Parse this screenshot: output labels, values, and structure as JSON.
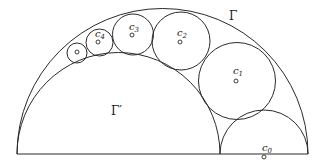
{
  "diagram": {
    "baseline": {
      "x1": 17,
      "x2": 308,
      "y": 154
    },
    "outer_arc": {
      "name": "Gamma",
      "label": "Γ",
      "cx": 162.5,
      "cy": 154,
      "r": 145.5,
      "label_pos": [
        229,
        20
      ]
    },
    "inner_arc": {
      "name": "Gamma-prime",
      "label": "Γ′",
      "cx": 118.5,
      "cy": 154,
      "r": 101.5,
      "label_pos": [
        111,
        115
      ]
    },
    "circles": [
      {
        "name": "c0",
        "label": "c",
        "sub": "0",
        "cx": 264,
        "cy": 154,
        "r": 44,
        "dot": [
          264,
          157
        ],
        "label_pos": [
          262,
          151
        ],
        "semicircle": true
      },
      {
        "name": "c1",
        "label": "c",
        "sub": "1",
        "cx": 237,
        "cy": 81,
        "r": 38.5,
        "dot": [
          236,
          81
        ],
        "label_pos": [
          233,
          74
        ]
      },
      {
        "name": "c2",
        "label": "c",
        "sub": "2",
        "cx": 181,
        "cy": 41,
        "r": 29,
        "dot": [
          180,
          42
        ],
        "label_pos": [
          177,
          36
        ]
      },
      {
        "name": "c3",
        "label": "c",
        "sub": "3",
        "cx": 133,
        "cy": 34.5,
        "r": 20.5,
        "dot": [
          132,
          35
        ],
        "label_pos": [
          129,
          30
        ]
      },
      {
        "name": "c4",
        "label": "c",
        "sub": "4",
        "cx": 99.5,
        "cy": 42.5,
        "r": 13.5,
        "dot": [
          98,
          42
        ],
        "label_pos": [
          95,
          37
        ]
      },
      {
        "name": "c5",
        "label": "",
        "sub": "",
        "cx": 77,
        "cy": 53,
        "r": 10,
        "dot": [
          77,
          52
        ],
        "label_pos": null
      }
    ]
  }
}
